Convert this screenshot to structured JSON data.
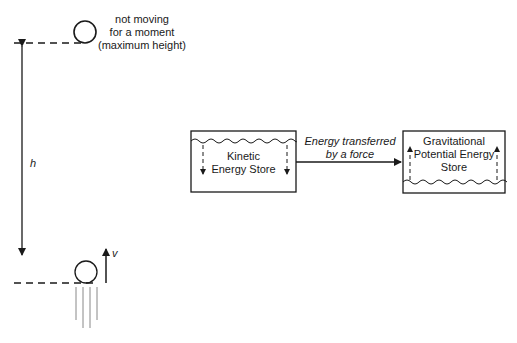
{
  "top_note": {
    "line1": "not moving",
    "line2": "for a moment",
    "line3": "(maximum height)"
  },
  "height_label": "h",
  "velocity_label": "v",
  "kinetic_store": {
    "line1": "Kinetic",
    "line2": "Energy Store"
  },
  "transfer": {
    "line1": "Energy transferred",
    "line2": "by a force"
  },
  "gpe_store": {
    "line1": "Gravitational",
    "line2": "Potential Energy",
    "line3": "Store"
  },
  "colors": {
    "stroke": "#1a1a1a",
    "motion_lines": "#888888"
  }
}
